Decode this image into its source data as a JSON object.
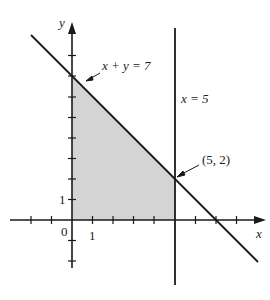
{
  "figure": {
    "axes": {
      "x_label": "x",
      "y_label": "y",
      "origin_label": "0",
      "x_unit_label": "1",
      "y_unit_label": "1"
    },
    "lines": [
      {
        "equation": "x + y = 7",
        "label": "x + y = 7"
      },
      {
        "equation": "x = 5",
        "label": "x = 5"
      }
    ],
    "points": [
      {
        "label": "(5, 2)",
        "x": 5,
        "y": 2
      }
    ],
    "shaded_region": {
      "description": "feasible region bounded by x >= 0, y >= 0, x <= 5, x + y <= 7",
      "vertices": [
        [
          0,
          0
        ],
        [
          5,
          0
        ],
        [
          5,
          2
        ],
        [
          0,
          7
        ]
      ],
      "fill": "#d4d4d4"
    },
    "colors": {
      "line": "#1a1a1a",
      "shade": "#d4d4d4",
      "text": "#222222"
    }
  }
}
